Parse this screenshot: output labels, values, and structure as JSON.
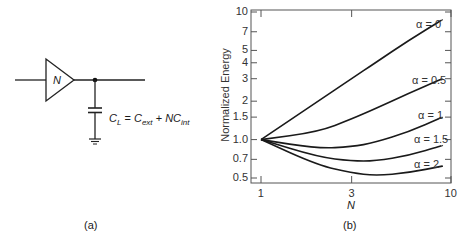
{
  "panel_a": {
    "caption": "(a)",
    "buffer_label": "N",
    "equation": {
      "lhs": "C",
      "lhs_sub": "L",
      "eq": " = ",
      "t1": "C",
      "t1_sub": "ext",
      "plus": " + ",
      "t2": "NC",
      "t2_sub": "int"
    }
  },
  "panel_b": {
    "caption": "(b)"
  },
  "chart_data": {
    "type": "line",
    "title": "",
    "xlabel": "N",
    "ylabel": "Normalized Energy",
    "xscale": "log",
    "yscale": "log",
    "xlim": [
      1,
      10
    ],
    "ylim": [
      0.5,
      10
    ],
    "xticks": [
      "1",
      "3",
      "10"
    ],
    "yticks": [
      "0.5",
      "0.7",
      "1.0",
      "1.5",
      "2",
      "3",
      "4",
      "5",
      "7",
      "10"
    ],
    "grid": false,
    "legend": "inline labels at right end of curves",
    "x": [
      1,
      2,
      3,
      4,
      6,
      9
    ],
    "series": [
      {
        "name": "α = 0",
        "values": [
          1.0,
          2.0,
          3.0,
          4.0,
          6.0,
          8.7
        ]
      },
      {
        "name": "α = 0.5",
        "values": [
          1.0,
          1.15,
          1.45,
          1.75,
          2.3,
          3.0
        ]
      },
      {
        "name": "α = 1",
        "values": [
          1.0,
          0.85,
          0.88,
          0.95,
          1.15,
          1.5
        ]
      },
      {
        "name": "α = 1.5",
        "values": [
          1.0,
          0.73,
          0.68,
          0.68,
          0.75,
          0.9
        ]
      },
      {
        "name": "α = 2",
        "values": [
          1.0,
          0.63,
          0.55,
          0.52,
          0.55,
          0.62
        ]
      }
    ],
    "labels": {
      "y_ticks": [
        {
          "text": "10",
          "v": 10
        },
        {
          "text": "7",
          "v": 7
        },
        {
          "text": "5",
          "v": 5
        },
        {
          "text": "4",
          "v": 4
        },
        {
          "text": "3",
          "v": 3
        },
        {
          "text": "2",
          "v": 2
        },
        {
          "text": "1.5",
          "v": 1.5
        },
        {
          "text": "1.0",
          "v": 1.0
        },
        {
          "text": "0.7",
          "v": 0.7
        },
        {
          "text": "0.5",
          "v": 0.5
        }
      ],
      "x_ticks": [
        {
          "text": "1",
          "v": 1
        },
        {
          "text": "3",
          "v": 3
        },
        {
          "text": "10",
          "v": 10
        }
      ]
    }
  }
}
